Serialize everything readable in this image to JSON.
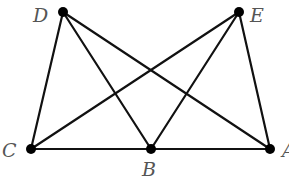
{
  "diagram": {
    "points": [
      {
        "id": "D",
        "label": "D",
        "x": 63,
        "y": 12,
        "lx": 33,
        "ly": 22
      },
      {
        "id": "E",
        "label": "E",
        "x": 239,
        "y": 12,
        "lx": 250,
        "ly": 22
      },
      {
        "id": "C",
        "label": "C",
        "x": 31,
        "y": 149,
        "lx": 2,
        "ly": 157
      },
      {
        "id": "B",
        "label": "B",
        "x": 151,
        "y": 149,
        "lx": 142,
        "ly": 176
      },
      {
        "id": "A",
        "label": "A",
        "x": 270,
        "y": 149,
        "lx": 282,
        "ly": 157
      }
    ],
    "segments": [
      [
        "D",
        "C"
      ],
      [
        "D",
        "B"
      ],
      [
        "D",
        "A"
      ],
      [
        "E",
        "C"
      ],
      [
        "E",
        "B"
      ],
      [
        "E",
        "A"
      ],
      [
        "C",
        "B"
      ],
      [
        "B",
        "A"
      ]
    ],
    "colors": {
      "line": "#111111",
      "label": "#555555",
      "point": "#000000"
    }
  }
}
